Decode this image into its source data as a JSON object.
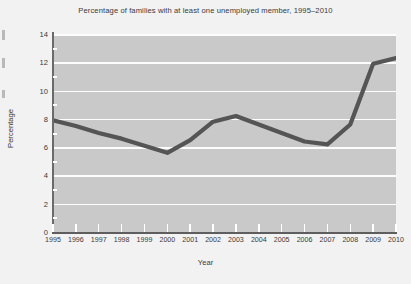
{
  "chart_data": {
    "type": "line",
    "title": "Percentage of families with at least one unemployed member, 1995–2010",
    "xlabel": "Year",
    "ylabel": "Percentage",
    "x": [
      1995,
      1996,
      1997,
      1998,
      1999,
      2000,
      2001,
      2002,
      2003,
      2004,
      2005,
      2006,
      2007,
      2008,
      2009,
      2010
    ],
    "categories": [
      "1995",
      "1996",
      "1997",
      "1998",
      "1999",
      "2000",
      "2001",
      "2002",
      "2003",
      "2004",
      "2005",
      "2006",
      "2007",
      "2008",
      "2009",
      "2010"
    ],
    "values": [
      7.9,
      7.5,
      7.0,
      6.6,
      6.1,
      5.6,
      6.5,
      7.8,
      8.2,
      7.6,
      7.0,
      6.4,
      6.2,
      7.6,
      11.9,
      12.3
    ],
    "series": [
      {
        "name": "Percentage of families with at least one unemployed member",
        "values": [
          7.9,
          7.5,
          7.0,
          6.6,
          6.1,
          5.6,
          6.5,
          7.8,
          8.2,
          7.6,
          7.0,
          6.4,
          6.2,
          7.6,
          11.9,
          12.3
        ]
      }
    ],
    "ylim": [
      0,
      14
    ],
    "yticks": [
      0,
      2,
      4,
      6,
      8,
      10,
      12,
      14
    ],
    "ytick_labels": [
      "0",
      "2",
      "4",
      "6",
      "8",
      "10",
      "12",
      "14"
    ],
    "xlim": [
      1995,
      2010
    ],
    "grid": "horizontal",
    "legend": "none",
    "colors": {
      "line": "#555555",
      "plot_background": "#c9c9c9",
      "figure_background": "#f2f2f2",
      "gridline": "#fdfdfd",
      "axis": "#5e5e5e",
      "text": "#3a3a3a"
    },
    "line_width_px": 4
  }
}
